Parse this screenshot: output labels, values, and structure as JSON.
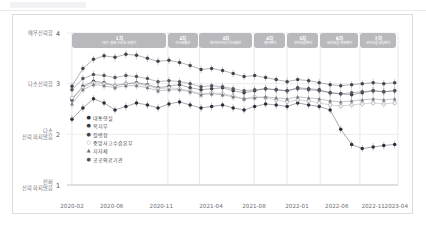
{
  "chart_data": {
    "type": "line",
    "title": "",
    "xlabel": "",
    "ylabel": "",
    "ylim": [
      1,
      4
    ],
    "grid": true,
    "legend_position": "inside-bottom-left",
    "y_ticks": [
      {
        "value": 4,
        "label": "매우신뢰함"
      },
      {
        "value": 3,
        "label": "다소신뢰함"
      },
      {
        "value": 2,
        "label": "다소\n신뢰하지않음"
      },
      {
        "value": 1,
        "label": "전혀\n신뢰하지않음"
      }
    ],
    "x_ticks": [
      "2020-02",
      "2020-06",
      "2020-11",
      "2021-04",
      "2021-08",
      "2022-01",
      "2022-06",
      "2022-11",
      "2023-04"
    ],
    "x_tick_positions": [
      0.015,
      0.135,
      0.285,
      0.435,
      0.565,
      0.695,
      0.815,
      0.925,
      0.995
    ],
    "annotations": [
      {
        "n": "1차",
        "desc": "대구·경북·수도권 유행기",
        "start": 0.015,
        "end": 0.3
      },
      {
        "n": "2차",
        "desc": "수도권확산",
        "start": 0.305,
        "end": 0.395
      },
      {
        "n": "3차",
        "desc": "변이바이러스 전국확산",
        "start": 0.4,
        "end": 0.56
      },
      {
        "n": "4차",
        "desc": "델타변이",
        "start": 0.565,
        "end": 0.66
      },
      {
        "n": "5차",
        "desc": "오미크론변이",
        "start": 0.665,
        "end": 0.76
      },
      {
        "n": "6차",
        "desc": "오미크론 하위변이",
        "start": 0.765,
        "end": 0.88
      },
      {
        "n": "7차",
        "desc": "오미크론 BQ변이",
        "start": 0.885,
        "end": 0.995
      }
    ],
    "series": [
      {
        "name": "대통령실",
        "marker": "circle-filled",
        "color": "#2d2d3a",
        "x": [
          0.015,
          0.048,
          0.08,
          0.112,
          0.145,
          0.178,
          0.21,
          0.243,
          0.275,
          0.308,
          0.34,
          0.372,
          0.405,
          0.437,
          0.47,
          0.502,
          0.535,
          0.567,
          0.6,
          0.632,
          0.665,
          0.697,
          0.73,
          0.762,
          0.795,
          0.827,
          0.86,
          0.892,
          0.925,
          0.957,
          0.99
        ],
        "y": [
          2.3,
          2.52,
          2.7,
          2.62,
          2.48,
          2.55,
          2.62,
          2.58,
          2.52,
          2.6,
          2.64,
          2.58,
          2.52,
          2.55,
          2.58,
          2.52,
          2.48,
          2.55,
          2.6,
          2.58,
          2.55,
          2.62,
          2.58,
          2.55,
          2.48,
          2.1,
          1.8,
          1.72,
          1.75,
          1.78,
          1.8
        ]
      },
      {
        "name": "복지부",
        "marker": "circle-filled",
        "color": "#3a3a46",
        "x": [
          0.015,
          0.048,
          0.08,
          0.112,
          0.145,
          0.178,
          0.21,
          0.243,
          0.275,
          0.308,
          0.34,
          0.372,
          0.405,
          0.437,
          0.47,
          0.502,
          0.535,
          0.567,
          0.6,
          0.632,
          0.665,
          0.697,
          0.73,
          0.762,
          0.795,
          0.827,
          0.86,
          0.892,
          0.925,
          0.957,
          0.99
        ],
        "y": [
          2.68,
          2.95,
          3.05,
          3.02,
          2.96,
          3.0,
          3.02,
          2.98,
          2.92,
          2.95,
          2.98,
          2.92,
          2.88,
          2.9,
          2.92,
          2.86,
          2.82,
          2.86,
          2.9,
          2.88,
          2.86,
          2.92,
          2.9,
          2.88,
          2.82,
          2.8,
          2.78,
          2.82,
          2.86,
          2.84,
          2.86
        ]
      },
      {
        "name": "질병청",
        "marker": "circle-filled",
        "color": "#44444f",
        "x": [
          0.015,
          0.048,
          0.08,
          0.112,
          0.145,
          0.178,
          0.21,
          0.243,
          0.275,
          0.308,
          0.34,
          0.372,
          0.405,
          0.437,
          0.47,
          0.502,
          0.535,
          0.567,
          0.6,
          0.632,
          0.665,
          0.697,
          0.73,
          0.762,
          0.795,
          0.827,
          0.86,
          0.892,
          0.925,
          0.957,
          0.99
        ],
        "y": [
          2.95,
          3.3,
          3.48,
          3.55,
          3.52,
          3.58,
          3.56,
          3.5,
          3.44,
          3.46,
          3.42,
          3.36,
          3.28,
          3.3,
          3.26,
          3.2,
          3.14,
          3.16,
          3.12,
          3.08,
          3.04,
          3.08,
          3.06,
          3.02,
          2.98,
          2.96,
          2.98,
          3.0,
          3.02,
          3.0,
          3.02
        ]
      },
      {
        "name": "중앙사고수습본부",
        "marker": "circle-open",
        "color": "#9a9aa4",
        "x": [
          0.015,
          0.048,
          0.08,
          0.112,
          0.145,
          0.178,
          0.21,
          0.243,
          0.275,
          0.308,
          0.34,
          0.372,
          0.405,
          0.437,
          0.47,
          0.502,
          0.535,
          0.567,
          0.6,
          0.632,
          0.665,
          0.697,
          0.73,
          0.762,
          0.795,
          0.827,
          0.86,
          0.892,
          0.925,
          0.957,
          0.99
        ],
        "y": [
          2.72,
          2.92,
          3.02,
          3.0,
          2.96,
          3.0,
          3.0,
          2.96,
          2.9,
          2.92,
          2.9,
          2.86,
          2.8,
          2.82,
          2.8,
          2.76,
          2.7,
          2.74,
          2.72,
          2.68,
          2.64,
          2.68,
          2.66,
          2.62,
          2.58,
          2.56,
          2.58,
          2.6,
          2.62,
          2.6,
          2.62
        ]
      },
      {
        "name": "지자체",
        "marker": "triangle",
        "color": "#70707b",
        "x": [
          0.015,
          0.048,
          0.08,
          0.112,
          0.145,
          0.178,
          0.21,
          0.243,
          0.275,
          0.308,
          0.34,
          0.372,
          0.405,
          0.437,
          0.47,
          0.502,
          0.535,
          0.567,
          0.6,
          0.632,
          0.665,
          0.697,
          0.73,
          0.762,
          0.795,
          0.827,
          0.86,
          0.892,
          0.925,
          0.957,
          0.99
        ],
        "y": [
          2.6,
          2.88,
          2.98,
          2.96,
          2.92,
          2.96,
          2.96,
          2.92,
          2.86,
          2.88,
          2.88,
          2.84,
          2.78,
          2.8,
          2.78,
          2.74,
          2.7,
          2.72,
          2.74,
          2.72,
          2.7,
          2.74,
          2.72,
          2.7,
          2.66,
          2.64,
          2.66,
          2.68,
          2.7,
          2.68,
          2.7
        ]
      },
      {
        "name": "공공의료기관",
        "marker": "circle-filled",
        "color": "#55555f",
        "x": [
          0.015,
          0.048,
          0.08,
          0.112,
          0.145,
          0.178,
          0.21,
          0.243,
          0.275,
          0.308,
          0.34,
          0.372,
          0.405,
          0.437,
          0.47,
          0.502,
          0.535,
          0.567,
          0.6,
          0.632,
          0.665,
          0.697,
          0.73,
          0.762,
          0.795,
          0.827,
          0.86,
          0.892,
          0.925,
          0.957,
          0.99
        ],
        "y": [
          2.88,
          3.1,
          3.18,
          3.16,
          3.12,
          3.16,
          3.14,
          3.1,
          3.04,
          3.06,
          3.04,
          3.0,
          2.94,
          2.96,
          2.94,
          2.9,
          2.86,
          2.88,
          2.9,
          2.88,
          2.86,
          2.9,
          2.88,
          2.86,
          2.82,
          2.8,
          2.82,
          2.84,
          2.86,
          2.84,
          2.86
        ]
      }
    ],
    "error_bar_halfwidth": 0.075
  }
}
